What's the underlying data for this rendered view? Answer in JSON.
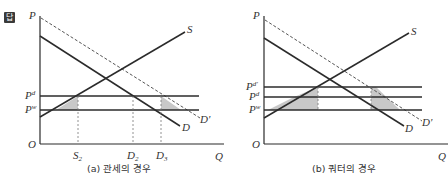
{
  "badge": "답",
  "panels": [
    {
      "caption": "(a) 관세의 경우",
      "axis": {
        "y": "P",
        "x": "Q",
        "origin": "O"
      },
      "price_lines": [
        {
          "label": "P",
          "sup": "d"
        },
        {
          "label": "P",
          "sup": "w"
        }
      ],
      "curves": {
        "supply": "S",
        "demand": "D",
        "demand_shifted": "D'"
      },
      "quantity_ticks": [
        {
          "label": "S",
          "sub": "2"
        },
        {
          "label": "D",
          "sub": "2"
        },
        {
          "label": "D",
          "sub": "3"
        }
      ]
    },
    {
      "caption": "(b) 쿼터의 경우",
      "axis": {
        "y": "P",
        "x": "Q",
        "origin": "O"
      },
      "price_lines": [
        {
          "label": "P",
          "sup": "d'"
        },
        {
          "label": "P",
          "sup": "d"
        },
        {
          "label": "P",
          "sup": "w"
        }
      ],
      "curves": {
        "supply": "S",
        "demand": "D",
        "demand_shifted": "D'"
      }
    }
  ],
  "colors": {
    "line": "#2b2b2b",
    "shade": "#c8c8c8",
    "dash": "#555555"
  }
}
